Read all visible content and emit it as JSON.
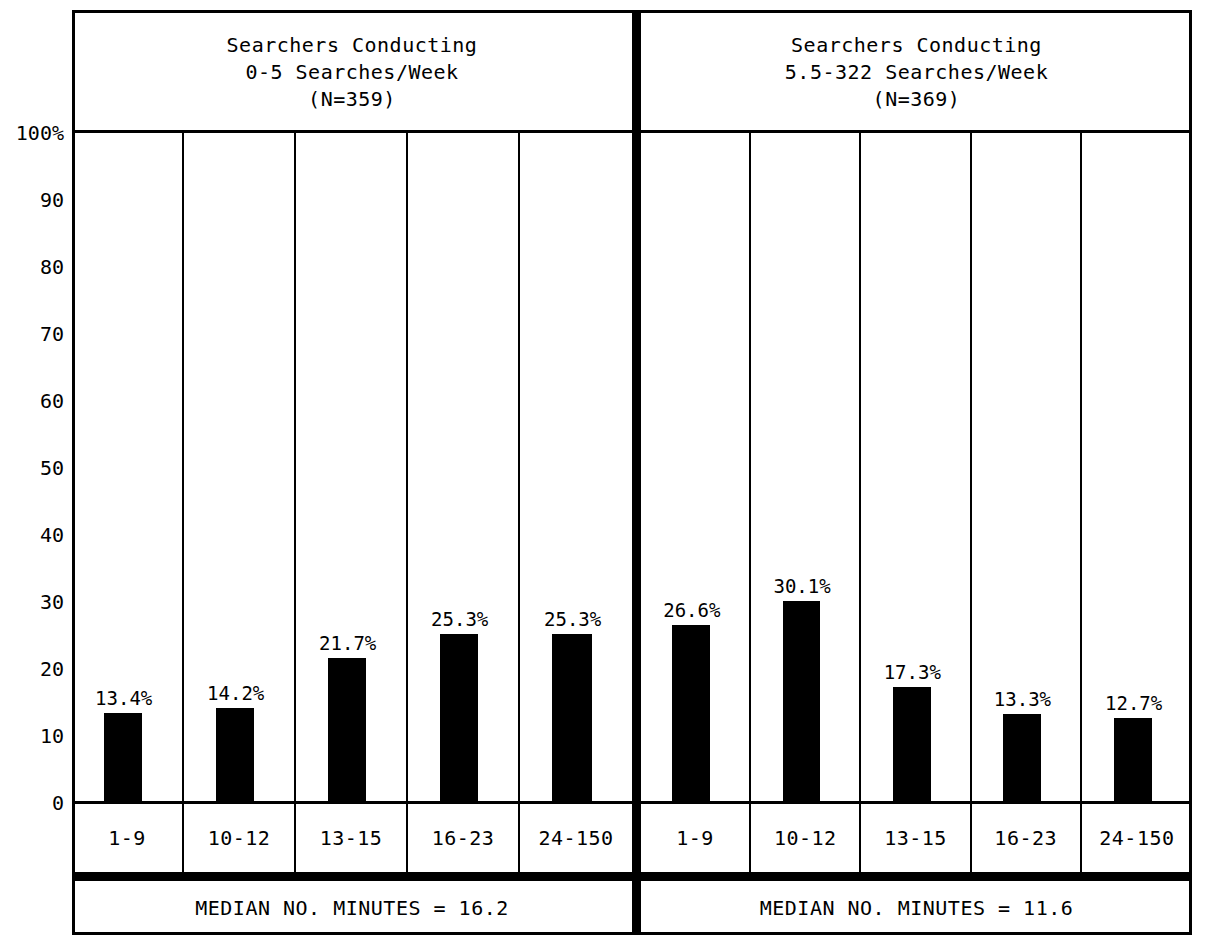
{
  "chart_data": {
    "type": "bar",
    "title": "",
    "xlabel": "",
    "ylabel": "",
    "ylim": [
      0,
      100
    ],
    "grid": false,
    "legend": "none",
    "axis": {
      "y_ticks": [
        "100%",
        "90",
        "80",
        "70",
        "60",
        "50",
        "40",
        "30",
        "20",
        "10",
        "0"
      ],
      "y_tick_values": [
        100,
        90,
        80,
        70,
        60,
        50,
        40,
        30,
        20,
        10,
        0
      ]
    },
    "categories": [
      "1-9",
      "10-12",
      "13-15",
      "16-23",
      "24-150"
    ],
    "panels": [
      {
        "header_lines": [
          "Searchers Conducting",
          "0-5 Searches/Week",
          "(N=359)"
        ],
        "n": 359,
        "values": [
          13.4,
          14.2,
          21.7,
          25.3,
          25.3
        ],
        "value_labels": [
          "13.4%",
          "14.2%",
          "21.7%",
          "25.3%",
          "25.3%"
        ],
        "footer": "MEDIAN NO. MINUTES = 16.2",
        "median_minutes": 16.2
      },
      {
        "header_lines": [
          "Searchers Conducting",
          "5.5-322 Searches/Week",
          "(N=369)"
        ],
        "n": 369,
        "values": [
          26.6,
          30.1,
          17.3,
          13.3,
          12.7
        ],
        "value_labels": [
          "26.6%",
          "30.1%",
          "17.3%",
          "13.3%",
          "12.7%"
        ],
        "footer": "MEDIAN NO. MINUTES = 11.6",
        "median_minutes": 11.6
      }
    ],
    "colors": {
      "bar": "#000000",
      "background": "#ffffff",
      "rule": "#000000"
    }
  }
}
